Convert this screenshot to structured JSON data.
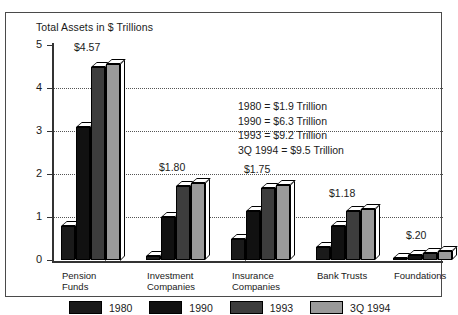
{
  "chart_data": {
    "type": "bar",
    "title": "Total Assets in $ Trillions",
    "xlabel": "",
    "ylabel": "",
    "ylim": [
      0,
      5
    ],
    "yticks": [
      0,
      1,
      2,
      3,
      4,
      5
    ],
    "grid": true,
    "legend_position": "bottom",
    "categories": [
      "Pension Funds",
      "Investment Companies",
      "Insurance Companies",
      "Bank Trusts",
      "Foundations"
    ],
    "category_lines": [
      [
        "Pension",
        "Funds"
      ],
      [
        "Investment",
        "Companies"
      ],
      [
        "Insurance",
        "Companies"
      ],
      [
        "Bank Trusts",
        ""
      ],
      [
        "Foundations",
        ""
      ]
    ],
    "series": [
      {
        "name": "1980",
        "color": "#1a1a1a",
        "values": [
          0.8,
          0.1,
          0.5,
          0.3,
          0.04
        ]
      },
      {
        "name": "1990",
        "color": "#111111",
        "values": [
          3.1,
          1.0,
          1.15,
          0.8,
          0.12
        ]
      },
      {
        "name": "1993",
        "color": "#3d3d3d",
        "values": [
          4.5,
          1.72,
          1.68,
          1.15,
          0.17
        ]
      },
      {
        "name": "3Q 1994",
        "color": "#9a9a9a",
        "values": [
          4.57,
          1.8,
          1.75,
          1.18,
          0.2
        ]
      }
    ],
    "data_labels": [
      "$4.57",
      "$1.80",
      "$1.75",
      "$1.18",
      "$.20"
    ],
    "annotation_lines": [
      "1980 = $1.9 Trillion",
      "1990 = $6.3 Trillion",
      "1993 = $9.2 Trillion",
      "3Q 1994 = $9.5 Trillion"
    ]
  }
}
